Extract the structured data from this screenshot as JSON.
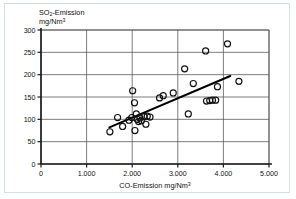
{
  "chart_data": {
    "type": "scatter",
    "title": "",
    "xlabel": "CO-Emission   mg/Nm³",
    "ylabel": "SO₂-Emission mg/Nm³",
    "xlim": [
      0,
      5000
    ],
    "ylim": [
      0,
      300
    ],
    "grid": true,
    "legend": "none",
    "x_ticks": [
      "0",
      "1.000",
      "2.000",
      "3.000",
      "4.000",
      "5.000"
    ],
    "x_tick_values": [
      0,
      1000,
      2000,
      3000,
      4000,
      5000
    ],
    "y_ticks": [
      "0",
      "50",
      "100",
      "150",
      "200",
      "250",
      "300"
    ],
    "y_tick_values": [
      0,
      50,
      100,
      150,
      200,
      250,
      300
    ],
    "points": [
      {
        "x": 1510,
        "y": 72
      },
      {
        "x": 1680,
        "y": 104
      },
      {
        "x": 1790,
        "y": 84
      },
      {
        "x": 1930,
        "y": 98
      },
      {
        "x": 1990,
        "y": 104
      },
      {
        "x": 2010,
        "y": 164
      },
      {
        "x": 2050,
        "y": 137
      },
      {
        "x": 2060,
        "y": 75
      },
      {
        "x": 2090,
        "y": 112
      },
      {
        "x": 2110,
        "y": 100
      },
      {
        "x": 2140,
        "y": 95
      },
      {
        "x": 2170,
        "y": 103
      },
      {
        "x": 2200,
        "y": 97
      },
      {
        "x": 2260,
        "y": 106
      },
      {
        "x": 2300,
        "y": 89
      },
      {
        "x": 2330,
        "y": 107
      },
      {
        "x": 2390,
        "y": 105
      },
      {
        "x": 2600,
        "y": 148
      },
      {
        "x": 2680,
        "y": 153
      },
      {
        "x": 2900,
        "y": 159
      },
      {
        "x": 3150,
        "y": 213
      },
      {
        "x": 3230,
        "y": 112
      },
      {
        "x": 3340,
        "y": 180
      },
      {
        "x": 3610,
        "y": 253
      },
      {
        "x": 3630,
        "y": 141
      },
      {
        "x": 3700,
        "y": 142
      },
      {
        "x": 3760,
        "y": 143
      },
      {
        "x": 3830,
        "y": 143
      },
      {
        "x": 3870,
        "y": 173
      },
      {
        "x": 4090,
        "y": 269
      },
      {
        "x": 4340,
        "y": 185
      }
    ],
    "trend_line": {
      "x1": 1500,
      "y1": 82,
      "x2": 4150,
      "y2": 197
    }
  }
}
